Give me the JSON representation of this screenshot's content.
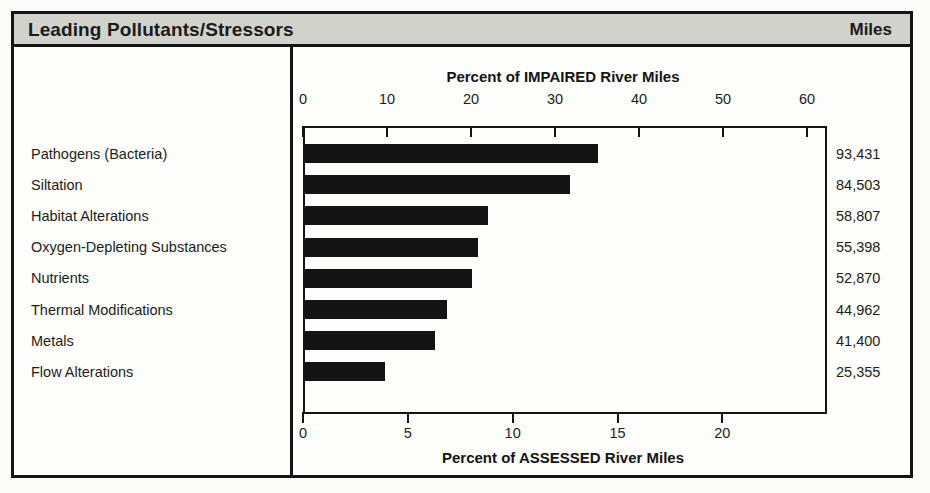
{
  "header": {
    "title": "Leading Pollutants/Stressors",
    "miles_label": "Miles"
  },
  "chart_data": {
    "type": "bar",
    "orientation": "horizontal",
    "title": "Leading Pollutants/Stressors",
    "top_axis_label": "Percent of IMPAIRED River Miles",
    "bottom_axis_label": "Percent of ASSESSED River Miles",
    "xlabel": "Percent of IMPAIRED River Miles",
    "ylabel": "",
    "grid": false,
    "legend": "none",
    "top_axis_ticks": [
      0,
      10,
      20,
      30,
      40,
      50,
      60
    ],
    "bottom_axis_ticks": [
      0,
      5,
      10,
      15,
      20
    ],
    "top_axis_tick_labels": [
      "0",
      "10",
      "20",
      "30",
      "40",
      "50",
      "60"
    ],
    "bottom_axis_tick_labels": [
      "0",
      "5",
      "10",
      "15",
      "20"
    ],
    "xlim": [
      0,
      61.9
    ],
    "bottom_xlim": [
      0,
      24.8
    ],
    "categories": [
      "Pathogens (Bacteria)",
      "Siltation",
      "Habitat Alterations",
      "Oxygen-Depleting Substances",
      "Nutrients",
      "Thermal Modifications",
      "Metals",
      "Flow Alterations"
    ],
    "values": [
      35.1,
      31.8,
      22.0,
      20.8,
      20.1,
      17.1,
      15.7,
      9.8
    ],
    "values_assessed": [
      14.1,
      12.7,
      8.8,
      8.3,
      8.1,
      6.9,
      6.3,
      3.9
    ],
    "miles": [
      "93,431",
      "84,503",
      "58,807",
      "55,398",
      "52,870",
      "44,962",
      "41,400",
      "25,355"
    ],
    "bar_color": "#141414"
  },
  "colors": {
    "header_band": "#d2d2cd",
    "frame": "#141414",
    "bar": "#141414",
    "paper": "#fbfbf9"
  }
}
